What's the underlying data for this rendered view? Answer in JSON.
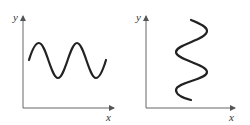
{
  "figures": [
    {
      "id": "left",
      "description": "Horizontal sine wave oscillating along x",
      "axes": {
        "x_label": "x",
        "y_label": "y"
      },
      "curve": {
        "orientation": "horizontal",
        "start": [
          29,
          60
        ],
        "peaks": [
          [
            39,
            43
          ],
          [
            77,
            43
          ]
        ],
        "troughs": [
          [
            58,
            78
          ],
          [
            96,
            78
          ]
        ],
        "end": [
          106,
          60
        ]
      }
    },
    {
      "id": "right",
      "description": "Vertical sine wave oscillating along y",
      "axes": {
        "x_label": "x",
        "y_label": "y"
      },
      "curve": {
        "orientation": "vertical",
        "start": [
          66,
          20
        ],
        "right_extrema": [
          [
            82,
            30
          ],
          [
            82,
            72
          ]
        ],
        "left_extrema": [
          [
            51,
            52
          ],
          [
            51,
            90
          ]
        ],
        "end": [
          66,
          100
        ]
      }
    }
  ],
  "colors": {
    "axis": "#666666",
    "curve": "#222222",
    "label": "#333333",
    "background": "#ffffff"
  }
}
